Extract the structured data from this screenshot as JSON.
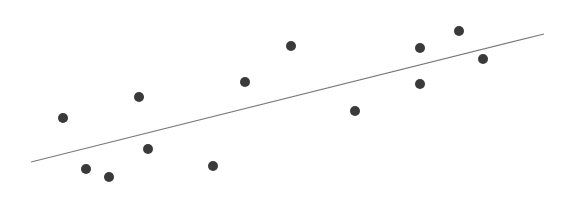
{
  "chart_data": {
    "type": "scatter",
    "title": "",
    "xlabel": "",
    "ylabel": "",
    "grid": false,
    "legend": null,
    "point_color": "#3a3a3a",
    "line_color": "#7a7a7a",
    "points_px": [
      {
        "x": 63,
        "y": 118
      },
      {
        "x": 86,
        "y": 169
      },
      {
        "x": 109,
        "y": 177
      },
      {
        "x": 139,
        "y": 97
      },
      {
        "x": 148,
        "y": 149
      },
      {
        "x": 213,
        "y": 166
      },
      {
        "x": 245,
        "y": 82
      },
      {
        "x": 291,
        "y": 46
      },
      {
        "x": 355,
        "y": 111
      },
      {
        "x": 420,
        "y": 48
      },
      {
        "x": 420,
        "y": 84
      },
      {
        "x": 459,
        "y": 31
      },
      {
        "x": 483,
        "y": 59
      }
    ],
    "trend_line_px": {
      "x1": 31,
      "y1": 162,
      "x2": 544,
      "y2": 34
    }
  }
}
